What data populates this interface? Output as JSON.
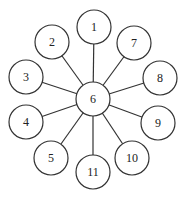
{
  "diagram": {
    "type": "star-graph",
    "hub": {
      "id": "6",
      "label": "6",
      "x": 93,
      "y": 99,
      "r": 17
    },
    "leaves": [
      {
        "id": "1",
        "label": "1",
        "x": 94,
        "y": 27,
        "r": 17
      },
      {
        "id": "2",
        "label": "2",
        "x": 52,
        "y": 42,
        "r": 17
      },
      {
        "id": "7",
        "label": "7",
        "x": 134,
        "y": 43,
        "r": 17
      },
      {
        "id": "3",
        "label": "3",
        "x": 26,
        "y": 77,
        "r": 17
      },
      {
        "id": "8",
        "label": "8",
        "x": 160,
        "y": 78,
        "r": 17
      },
      {
        "id": "4",
        "label": "4",
        "x": 26,
        "y": 122,
        "r": 17
      },
      {
        "id": "9",
        "label": "9",
        "x": 158,
        "y": 123,
        "r": 17
      },
      {
        "id": "5",
        "label": "5",
        "x": 51,
        "y": 158,
        "r": 17
      },
      {
        "id": "10",
        "label": "10",
        "x": 132,
        "y": 158,
        "r": 17
      },
      {
        "id": "11",
        "label": "11",
        "x": 93,
        "y": 172,
        "r": 17
      }
    ],
    "edges": [
      [
        "6",
        "1"
      ],
      [
        "6",
        "2"
      ],
      [
        "6",
        "7"
      ],
      [
        "6",
        "3"
      ],
      [
        "6",
        "8"
      ],
      [
        "6",
        "4"
      ],
      [
        "6",
        "9"
      ],
      [
        "6",
        "5"
      ],
      [
        "6",
        "10"
      ],
      [
        "6",
        "11"
      ]
    ]
  }
}
